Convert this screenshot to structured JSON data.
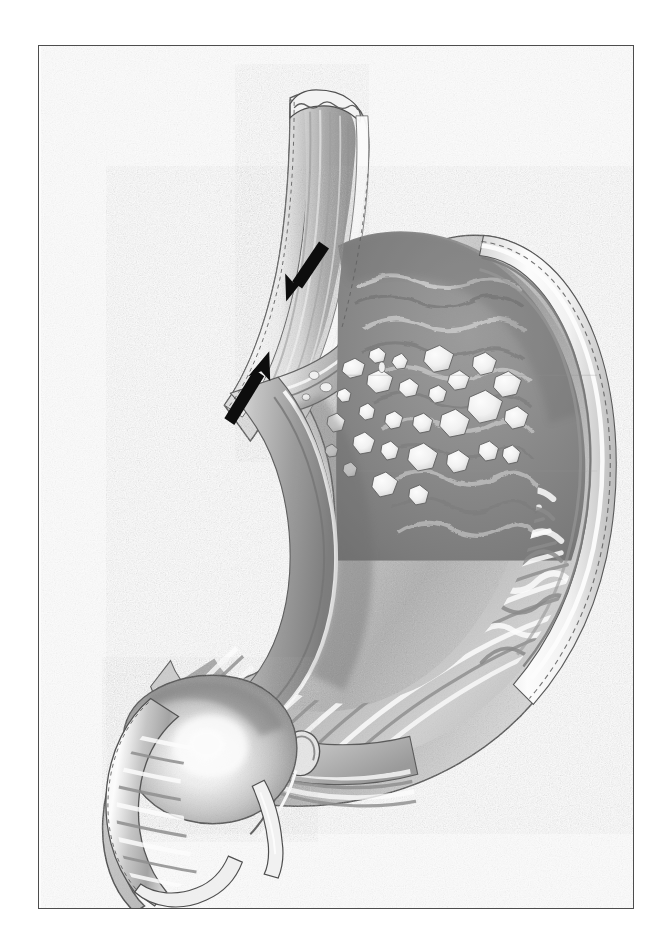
{
  "figure": {
    "kind": "medical-anatomical-illustration",
    "style": "grayscale-airbrush-pencil-rendering",
    "title": "",
    "caption": "",
    "has_visible_text": false,
    "background_color": "#ffffff",
    "frame": {
      "name": "figure-border",
      "color": "#4d4d4d",
      "width_px": 1.6,
      "x": 38,
      "y": 45,
      "w": 596,
      "h": 864
    },
    "palette": {
      "paper": "#ffffff",
      "serosa_highlight": "#f7f7f7",
      "muscularis_mid": "#b9b9b9",
      "lumen_shadow": "#6f6f6f",
      "mucosa_dark": "#8a8a8a",
      "rugae_light": "#e4e4e4",
      "rugae_shade": "#9a9a9a",
      "plaque_white": "#fbfbfb",
      "outline_dark": "#3a3a3a",
      "arrow_black": "#0a0a0a"
    },
    "structures": [
      {
        "id": "esophagus",
        "label": "Esophagus (cut end)",
        "note": "vertical tube, upper-left, longitudinal mucosal striations, scalloped cut rim"
      },
      {
        "id": "ge-junction",
        "label": "Gastroesophageal junction / cardia",
        "note": "narrow angulated neck indicated by the two arrows"
      },
      {
        "id": "fundus",
        "label": "Fundus",
        "note": "dome at upper right, dark mucosal field"
      },
      {
        "id": "body",
        "label": "Body (corpus)",
        "note": "large curved chamber with prominent rugal folds"
      },
      {
        "id": "greater-curvature",
        "label": "Greater curvature",
        "note": "long convex right/lower border"
      },
      {
        "id": "lesser-curvature",
        "label": "Lesser curvature",
        "note": "short concave left/upper border"
      },
      {
        "id": "antrum",
        "label": "Antrum",
        "note": "tapering lower-left channel with transverse folds"
      },
      {
        "id": "pylorus",
        "label": "Pylorus",
        "note": "constricted ring just left of the antrum"
      },
      {
        "id": "duodenal-bulb",
        "label": "Duodenal bulb",
        "note": "rounded bulb at lower left with cut duodenal stub"
      },
      {
        "id": "rugae",
        "label": "Gastric rugae",
        "note": "parallel mucosal folds lining body and antrum"
      },
      {
        "id": "plaques",
        "label": "Mucosal plaques / lesions",
        "note": "scattered irregular white raised patches across fundus and upper body"
      }
    ],
    "arrows": [
      {
        "id": "arrow-upper",
        "name": "annotation-arrow-upper",
        "points_to": "gastroesophageal junction, anterior/upper aspect",
        "direction": "down-left",
        "angle_deg": 250,
        "tip": {
          "x": 286,
          "y": 286
        },
        "tail": {
          "x": 317,
          "y": 239
        },
        "color": "#0a0a0a"
      },
      {
        "id": "arrow-lower",
        "name": "annotation-arrow-lower",
        "points_to": "gastroesophageal junction, inferior/lower aspect",
        "direction": "up-right",
        "angle_deg": 55,
        "tip": {
          "x": 259,
          "y": 358
        },
        "tail": {
          "x": 225,
          "y": 410
        },
        "color": "#0a0a0a"
      }
    ],
    "plaque_count_visible": 28
  }
}
